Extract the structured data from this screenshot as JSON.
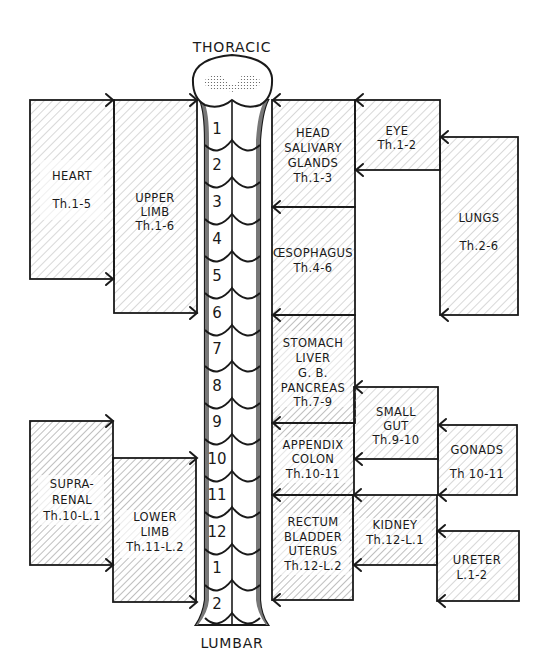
{
  "diagram": {
    "top_label": "THORACIC",
    "bottom_label": "LUMBAR",
    "segments": [
      "1",
      "2",
      "3",
      "4",
      "5",
      "6",
      "7",
      "8",
      "9",
      "10",
      "11",
      "12",
      "1",
      "2"
    ],
    "left_boxes": [
      {
        "id": "heart",
        "lines": [
          "HEART",
          "Th.1-5"
        ]
      },
      {
        "id": "upper-limb",
        "lines": [
          "UPPER",
          "LIMB",
          "Th.1-6"
        ]
      },
      {
        "id": "suprarenal",
        "lines": [
          "SUPRA-",
          "RENAL",
          "Th.10-L.1"
        ]
      },
      {
        "id": "lower-limb",
        "lines": [
          "LOWER",
          "LIMB",
          "Th.11-L.2"
        ]
      }
    ],
    "right_boxes": [
      {
        "id": "head-salivary",
        "lines": [
          "HEAD",
          "SALIVARY",
          "GLANDS",
          "Th.1-3"
        ]
      },
      {
        "id": "eye",
        "lines": [
          "EYE",
          "Th.1-2"
        ]
      },
      {
        "id": "lungs",
        "lines": [
          "LUNGS",
          "Th.2-6"
        ]
      },
      {
        "id": "oesophagus",
        "lines": [
          "ŒSOPHAGUS",
          "Th.4-6"
        ]
      },
      {
        "id": "stomach",
        "lines": [
          "STOMACH",
          "LIVER",
          "G. B.",
          "PANCREAS",
          "Th.7-9"
        ]
      },
      {
        "id": "small-gut",
        "lines": [
          "SMALL",
          "GUT",
          "Th.9-10"
        ]
      },
      {
        "id": "appendix",
        "lines": [
          "APPENDIX",
          "COLON",
          "Th.10-11"
        ]
      },
      {
        "id": "gonads",
        "lines": [
          "GONADS",
          "Th 10-11"
        ]
      },
      {
        "id": "rectum",
        "lines": [
          "RECTUM",
          "BLADDER",
          "UTERUS",
          "Th.12-L.2"
        ]
      },
      {
        "id": "kidney",
        "lines": [
          "KIDNEY",
          "Th.12-L.1"
        ]
      },
      {
        "id": "ureter",
        "lines": [
          "URETER",
          "L.1-2"
        ]
      }
    ]
  }
}
